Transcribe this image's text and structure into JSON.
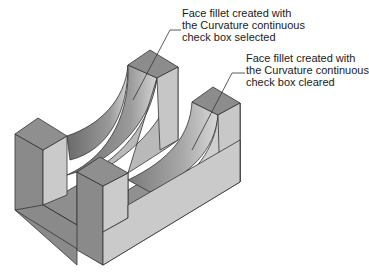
{
  "figure": {
    "colors": {
      "background": "#ffffff",
      "top_face": "#8c8c8c",
      "left_face": "#8a8a8a",
      "right_face": "#c8c8c8",
      "fillet_dark": "#6e6e6e",
      "fillet_light": "#d0d0d0",
      "edge": "#333333",
      "text": "#1a1a1a"
    }
  },
  "callouts": [
    {
      "id": "selected",
      "lines": [
        "Face fillet created with",
        "the Curvature continuous",
        "check box selected"
      ]
    },
    {
      "id": "cleared",
      "lines": [
        "Face fillet created with",
        "the Curvature continuous",
        "check box cleared"
      ]
    }
  ]
}
